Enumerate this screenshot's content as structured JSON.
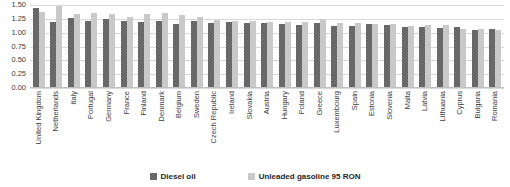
{
  "chart_data": {
    "type": "bar",
    "title": "",
    "subtitle": "",
    "xlabel": "",
    "ylabel": "",
    "ylim": [
      0.0,
      1.5
    ],
    "yticks": [
      "1.50",
      "1.25",
      "1.00",
      "0.75",
      "0.50",
      "0.25",
      "0.00"
    ],
    "ytick_values": [
      1.5,
      1.25,
      1.0,
      0.75,
      0.5,
      0.25,
      0.0
    ],
    "grid": true,
    "legend_position": "bottom",
    "categories": [
      "United Kingdom",
      "Netherlands",
      "Italy",
      "Portugal",
      "Germany",
      "France",
      "Finland",
      "Denmark",
      "Belgium",
      "Sweden",
      "Czech Republic",
      "Ireland",
      "Slovakia",
      "Austria",
      "Hungary",
      "Poland",
      "Greece",
      "Luxembourg",
      "Spain",
      "Estonia",
      "Slovenia",
      "Malta",
      "Latvia",
      "Lithuania",
      "Cyprus",
      "Bulgaria",
      "Romania"
    ],
    "series": [
      {
        "name": "Diesel oil",
        "color": "#595959",
        "values": [
          1.45,
          1.19,
          1.26,
          1.21,
          1.24,
          1.21,
          1.2,
          1.21,
          1.15,
          1.21,
          1.17,
          1.19,
          1.18,
          1.17,
          1.16,
          1.14,
          1.17,
          1.12,
          1.12,
          1.15,
          1.13,
          1.11,
          1.11,
          1.09,
          1.1,
          1.05,
          1.06
        ]
      },
      {
        "name": "Unleaded gasoline 95 RON",
        "color": "#c9c9c9",
        "values": [
          1.37,
          1.49,
          1.33,
          1.36,
          1.34,
          1.29,
          1.33,
          1.35,
          1.32,
          1.29,
          1.23,
          1.22,
          1.21,
          1.2,
          1.2,
          1.19,
          1.25,
          1.17,
          1.18,
          1.16,
          1.15,
          1.12,
          1.13,
          1.13,
          1.07,
          1.07,
          1.04
        ]
      }
    ]
  },
  "legend": {
    "items": [
      {
        "label": "Diesel oil",
        "key": "diesel"
      },
      {
        "label": "Unleaded gasoline 95 RON",
        "key": "gasoline"
      }
    ]
  }
}
